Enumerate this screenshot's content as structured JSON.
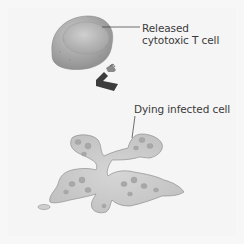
{
  "diagram": {
    "labels": {
      "tcell_line1": "Released",
      "tcell_line2": "cytotoxic T cell",
      "dying_cell": "Dying infected cell"
    },
    "colors": {
      "background": "#f5f5f5",
      "tcell_body": "#a9a9a9",
      "tcell_nucleus": "#b8b8b8",
      "receptor_dark": "#3c3c3c",
      "receptor_light": "#8a8a8a",
      "dying_cell_fill": "#c9c9c9",
      "dying_cell_outline": "#8e8e8e",
      "vesicle": "#a8a8a8",
      "label_text": "#3a3a3a",
      "leader_line": "#333333"
    }
  }
}
